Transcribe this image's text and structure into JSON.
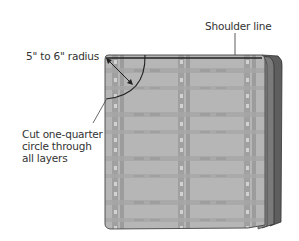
{
  "diagram": {
    "labels": {
      "shoulder_line": "Shoulder line",
      "radius": "5\" to 6\" radius",
      "cut_instruction": [
        "Cut one-quarter",
        "circle through",
        "all layers"
      ]
    },
    "colors": {
      "fabric_base": "#b4b4b4",
      "fabric_stripe": "#9a9a9a",
      "fabric_highlight": "#c8c8c8",
      "layer_dark": "#5a5a5a",
      "layer_mid": "#7a7a7a",
      "outline": "#333333",
      "text": "#333333"
    }
  }
}
